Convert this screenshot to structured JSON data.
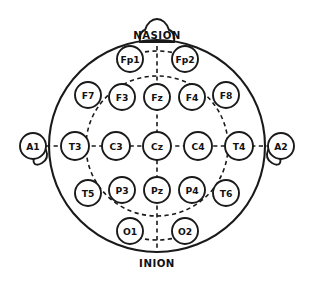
{
  "diagram": {
    "type": "head-map",
    "colors": {
      "stroke": "#1a1a1a",
      "fill": "#ffffff",
      "text": "#111111",
      "background": "#ffffff"
    },
    "head": {
      "cx": 157,
      "cy": 146,
      "rx": 108,
      "ry": 106
    },
    "inner_ring": {
      "cx": 157,
      "cy": 146,
      "rx": 71,
      "ry": 70
    },
    "landmarks": [
      {
        "name": "nasion",
        "label": "NASION",
        "x": 157,
        "y": 35
      },
      {
        "name": "inion",
        "label": "INION",
        "x": 157,
        "y": 263
      }
    ],
    "reference_electrodes": [
      {
        "name": "A1",
        "label": "A1",
        "x": 33,
        "y": 146,
        "r": 13,
        "side": "left"
      },
      {
        "name": "A2",
        "label": "A2",
        "x": 281,
        "y": 146,
        "r": 13,
        "side": "right"
      }
    ],
    "electrodes": [
      {
        "name": "Fp1",
        "label": "Fp1",
        "x": 130,
        "y": 59,
        "r": 13,
        "row": "prefrontal",
        "hemisphere": "left"
      },
      {
        "name": "Fp2",
        "label": "Fp2",
        "x": 185,
        "y": 59,
        "r": 13,
        "row": "prefrontal",
        "hemisphere": "right"
      },
      {
        "name": "F7",
        "label": "F7",
        "x": 88,
        "y": 95,
        "r": 13,
        "row": "frontal",
        "hemisphere": "left"
      },
      {
        "name": "F3",
        "label": "F3",
        "x": 122,
        "y": 97,
        "r": 13,
        "row": "frontal",
        "hemisphere": "left"
      },
      {
        "name": "Fz",
        "label": "Fz",
        "x": 157,
        "y": 97,
        "r": 13,
        "row": "frontal",
        "hemisphere": "midline"
      },
      {
        "name": "F4",
        "label": "F4",
        "x": 192,
        "y": 97,
        "r": 13,
        "row": "frontal",
        "hemisphere": "right"
      },
      {
        "name": "F8",
        "label": "F8",
        "x": 226,
        "y": 95,
        "r": 13,
        "row": "frontal",
        "hemisphere": "right"
      },
      {
        "name": "T3",
        "label": "T3",
        "x": 75,
        "y": 146,
        "r": 14,
        "row": "central",
        "hemisphere": "left"
      },
      {
        "name": "C3",
        "label": "C3",
        "x": 116,
        "y": 146,
        "r": 14,
        "row": "central",
        "hemisphere": "left"
      },
      {
        "name": "Cz",
        "label": "Cz",
        "x": 157,
        "y": 146,
        "r": 14,
        "row": "central",
        "hemisphere": "midline"
      },
      {
        "name": "C4",
        "label": "C4",
        "x": 198,
        "y": 146,
        "r": 14,
        "row": "central",
        "hemisphere": "right"
      },
      {
        "name": "T4",
        "label": "T4",
        "x": 239,
        "y": 146,
        "r": 14,
        "row": "central",
        "hemisphere": "right"
      },
      {
        "name": "T5",
        "label": "T5",
        "x": 88,
        "y": 193,
        "r": 13,
        "row": "parietal",
        "hemisphere": "left"
      },
      {
        "name": "P3",
        "label": "P3",
        "x": 122,
        "y": 190,
        "r": 13,
        "row": "parietal",
        "hemisphere": "left"
      },
      {
        "name": "Pz",
        "label": "Pz",
        "x": 157,
        "y": 190,
        "r": 13,
        "row": "parietal",
        "hemisphere": "midline"
      },
      {
        "name": "P4",
        "label": "P4",
        "x": 192,
        "y": 190,
        "r": 13,
        "row": "parietal",
        "hemisphere": "right"
      },
      {
        "name": "T6",
        "label": "T6",
        "x": 226,
        "y": 193,
        "r": 13,
        "row": "parietal",
        "hemisphere": "right"
      },
      {
        "name": "O1",
        "label": "O1",
        "x": 130,
        "y": 231,
        "r": 13,
        "row": "occipital",
        "hemisphere": "left"
      },
      {
        "name": "O2",
        "label": "O2",
        "x": 185,
        "y": 231,
        "r": 13,
        "row": "occipital",
        "hemisphere": "right"
      }
    ]
  }
}
